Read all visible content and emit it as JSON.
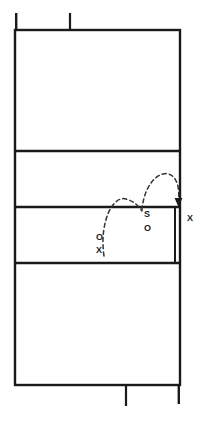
{
  "diagram": {
    "colors": {
      "line": "#1a1a1a",
      "background": "#ffffff",
      "trajectory": "#333333"
    },
    "court": {
      "left": 15,
      "right": 180,
      "top": 30,
      "bottom": 385,
      "line_width": 2.4
    },
    "horizontal_lines": [
      151,
      207,
      263
    ],
    "net_antenna": {
      "left_post_top": 13,
      "tick_top_x": 70,
      "tick_top_y": 13
    },
    "bottom_tick": {
      "x": 126,
      "y": 406
    },
    "inner_sideline": {
      "x": 175,
      "y_top": 207,
      "y_bottom": 263
    },
    "labels": {
      "left_o": "O",
      "left_x": "X",
      "right_s": "S",
      "right_o": "O",
      "far_x": "X"
    },
    "trajectory": {
      "dash_pattern": "4,3",
      "stroke_width": 1.4,
      "arc_one": "M 104,256 C 100,224 112,196 125,199 C 133,201 138,205 142,210",
      "arc_two": "M 142,209 C 143,196 150,178 162,174 C 174,171 179,184 178,199",
      "arrow_tip_x": 178,
      "arrow_tip_y": 207
    }
  }
}
